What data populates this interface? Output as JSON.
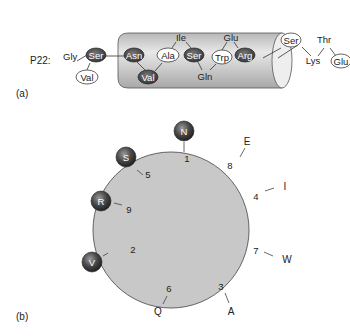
{
  "panel_a": {
    "label": "(a)",
    "peptide_name": "P22:",
    "outside_left": [
      {
        "name": "Gly",
        "style": "plain"
      },
      {
        "name": "Ser",
        "style": "dark"
      },
      {
        "name": "Val",
        "style": "light"
      }
    ],
    "inside_helix": [
      {
        "name": "Asn",
        "style": "dark"
      },
      {
        "name": "Val",
        "style": "dark"
      },
      {
        "name": "Ala",
        "style": "light"
      },
      {
        "name": "Ile",
        "style": "plain"
      },
      {
        "name": "Ser",
        "style": "dark"
      },
      {
        "name": "Gln",
        "style": "plain"
      },
      {
        "name": "Trp",
        "style": "light"
      },
      {
        "name": "Glu",
        "style": "plain"
      },
      {
        "name": "Arg",
        "style": "dark"
      }
    ],
    "outside_right": [
      {
        "name": "Ser",
        "style": "light"
      },
      {
        "name": "Lys",
        "style": "plain"
      },
      {
        "name": "Thr",
        "style": "plain"
      },
      {
        "name": "Glu",
        "style": "light"
      }
    ]
  },
  "panel_b": {
    "label": "(b)",
    "positions": [
      {
        "num": "1",
        "residue": "N",
        "hydrophobic_ball": true
      },
      {
        "num": "2",
        "residue": "V",
        "hydrophobic_ball": true
      },
      {
        "num": "3",
        "residue": "A",
        "hydrophobic_ball": false
      },
      {
        "num": "4",
        "residue": "I",
        "hydrophobic_ball": false
      },
      {
        "num": "5",
        "residue": "S",
        "hydrophobic_ball": true
      },
      {
        "num": "6",
        "residue": "Q",
        "hydrophobic_ball": false
      },
      {
        "num": "7",
        "residue": "W",
        "hydrophobic_ball": false
      },
      {
        "num": "8",
        "residue": "E",
        "hydrophobic_ball": false
      },
      {
        "num": "9",
        "residue": "R",
        "hydrophobic_ball": true
      }
    ]
  },
  "colors": {
    "wheel_fill": "#c8c8c8",
    "wheel_stroke": "#555555",
    "dark_residue": "#3a3a3a",
    "cylinder_fill": "#d4d4d4"
  }
}
